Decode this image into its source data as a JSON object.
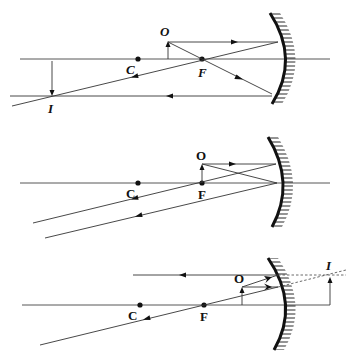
{
  "diagrams": [
    {
      "id": "object-between-C-and-F",
      "labels": {
        "object": "O",
        "center": "C",
        "focus": "F",
        "image": "I"
      },
      "image_type": "real, inverted, magnified"
    },
    {
      "id": "object-at-F",
      "labels": {
        "object": "O",
        "center": "C",
        "focus": "F"
      },
      "image_type": "no image (reflected rays parallel)"
    },
    {
      "id": "object-inside-F",
      "labels": {
        "object": "O",
        "center": "C",
        "focus": "F",
        "image": "I"
      },
      "image_type": "virtual, upright, magnified"
    }
  ],
  "colors": {
    "line": "#333333",
    "mirror": "#111111",
    "background": "#ffffff"
  }
}
